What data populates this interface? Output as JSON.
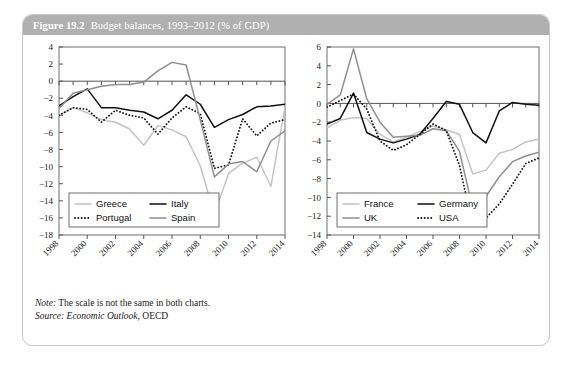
{
  "figure": {
    "number": "Figure 19.2",
    "caption": "Budget balances, 1993–2012 (% of GDP)",
    "header_bg": "#b0b0b0",
    "card_border": "#c9c9c9"
  },
  "notes": {
    "note_label": "Note:",
    "note_text": " The scale is not the same in both charts.",
    "source_label": "Source:",
    "source_italic": " Economic Outlook",
    "source_rest": ", OECD"
  },
  "colors": {
    "black": "#111111",
    "mid_gray": "#8f8f8f",
    "light_gray": "#c4c4c4",
    "axis": "#555555",
    "frame": "#6e6e6e"
  },
  "chart_data": [
    {
      "id": "left",
      "type": "line",
      "title": "",
      "xlabel": "",
      "ylabel": "",
      "xlim": [
        1998,
        2014
      ],
      "ylim": [
        -18,
        4
      ],
      "ytick_step": 2,
      "yticks": [
        4,
        2,
        0,
        -2,
        -4,
        -6,
        -8,
        -10,
        -12,
        -14,
        -16,
        -18
      ],
      "ytick_labels": [
        "4",
        "2",
        "0",
        "−2",
        "−4",
        "−6",
        "−8",
        "−10",
        "−12",
        "−14",
        "−16",
        "−18"
      ],
      "xticks": [
        1998,
        2000,
        2002,
        2004,
        2006,
        2008,
        2010,
        2012,
        2014
      ],
      "xtick_labels": [
        "1998",
        "2000",
        "2002",
        "2004",
        "2006",
        "2008",
        "2010",
        "2012",
        "2014"
      ],
      "x": [
        1998,
        1999,
        2000,
        2001,
        2002,
        2003,
        2004,
        2005,
        2006,
        2007,
        2008,
        2009,
        2010,
        2011,
        2012,
        2013,
        2014
      ],
      "grid": false,
      "legend_position": "bottom-left",
      "series": [
        {
          "name": "Greece",
          "style": "solid",
          "color": "#c4c4c4",
          "values": [
            -4.0,
            -3.1,
            -3.7,
            -4.5,
            -4.8,
            -5.6,
            -7.5,
            -5.2,
            -5.7,
            -6.5,
            -9.9,
            -15.6,
            -10.8,
            -9.6,
            -8.9,
            -12.3,
            -3.0
          ]
        },
        {
          "name": "Italy",
          "style": "solid",
          "color": "#111111",
          "values": [
            -2.9,
            -1.8,
            -0.9,
            -3.1,
            -3.1,
            -3.4,
            -3.6,
            -4.4,
            -3.4,
            -1.6,
            -2.7,
            -5.4,
            -4.5,
            -3.9,
            -3.0,
            -2.9,
            -2.7
          ]
        },
        {
          "name": "Portugal",
          "style": "dotted",
          "color": "#111111",
          "values": [
            -4.0,
            -3.1,
            -3.3,
            -4.8,
            -3.4,
            -4.0,
            -4.3,
            -6.2,
            -4.3,
            -3.0,
            -3.8,
            -10.2,
            -9.8,
            -4.4,
            -6.4,
            -4.9,
            -4.5
          ]
        },
        {
          "name": "Spain",
          "style": "solid",
          "color": "#8f8f8f",
          "values": [
            -3.2,
            -1.4,
            -1.0,
            -0.6,
            -0.4,
            -0.4,
            -0.1,
            1.2,
            2.2,
            1.9,
            -4.5,
            -11.2,
            -9.7,
            -9.4,
            -10.6,
            -7.0,
            -5.8
          ]
        }
      ]
    },
    {
      "id": "right",
      "type": "line",
      "title": "",
      "xlabel": "",
      "ylabel": "",
      "xlim": [
        1998,
        2014
      ],
      "ylim": [
        -14,
        6
      ],
      "ytick_step": 2,
      "yticks": [
        6,
        4,
        2,
        0,
        -2,
        -4,
        -6,
        -8,
        -10,
        -12,
        -14
      ],
      "ytick_labels": [
        "6",
        "4",
        "2",
        "0",
        "−2",
        "−4",
        "−6",
        "−8",
        "−10",
        "−12",
        "−14"
      ],
      "xticks": [
        1998,
        2000,
        2002,
        2004,
        2006,
        2008,
        2010,
        2012,
        2014
      ],
      "xtick_labels": [
        "1998",
        "2000",
        "2002",
        "2004",
        "2006",
        "2008",
        "2010",
        "2012",
        "2014"
      ],
      "x": [
        1998,
        1999,
        2000,
        2001,
        2002,
        2003,
        2004,
        2005,
        2006,
        2007,
        2008,
        2009,
        2010,
        2011,
        2012,
        2013,
        2014
      ],
      "grid": false,
      "legend_position": "bottom-left",
      "series": [
        {
          "name": "France",
          "style": "solid",
          "color": "#c4c4c4",
          "values": [
            -2.6,
            -1.8,
            -1.5,
            -1.6,
            -3.3,
            -4.1,
            -3.6,
            -3.0,
            -2.4,
            -2.8,
            -3.3,
            -7.5,
            -7.1,
            -5.3,
            -4.9,
            -4.1,
            -3.8
          ]
        },
        {
          "name": "Germany",
          "style": "solid",
          "color": "#111111",
          "values": [
            -2.2,
            -1.6,
            1.1,
            -3.1,
            -3.8,
            -4.2,
            -3.8,
            -3.3,
            -1.6,
            0.2,
            -0.1,
            -3.1,
            -4.2,
            -0.8,
            0.1,
            -0.1,
            -0.2
          ]
        },
        {
          "name": "UK",
          "style": "solid",
          "color": "#8f8f8f",
          "values": [
            -0.1,
            0.9,
            5.8,
            0.5,
            -2.0,
            -3.6,
            -3.5,
            -3.4,
            -2.7,
            -2.9,
            -5.1,
            -11.2,
            -9.9,
            -7.8,
            -6.2,
            -5.6,
            -5.2
          ]
        },
        {
          "name": "USA",
          "style": "dotted",
          "color": "#111111",
          "values": [
            -0.4,
            0.3,
            1.0,
            -0.6,
            -4.0,
            -5.0,
            -4.4,
            -3.3,
            -2.2,
            -2.9,
            -6.6,
            -13.1,
            -12.2,
            -10.7,
            -8.6,
            -6.4,
            -5.8
          ]
        }
      ]
    }
  ]
}
